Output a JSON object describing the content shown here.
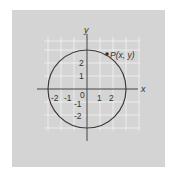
{
  "diagram": {
    "axes": {
      "x_label": "x",
      "y_label": "y",
      "x_ticks": [
        "-2",
        "-1",
        "0",
        "1",
        "2"
      ],
      "y_ticks": [
        "2",
        "1",
        "-1",
        "-2"
      ],
      "origin_label": "0"
    },
    "circle": {
      "center": [
        0,
        0
      ],
      "radius": 3
    },
    "point": {
      "label": "P(x, y)",
      "position": "on circle, upper right"
    },
    "colors": {
      "panel": "#d4d4d4",
      "grid": "#f2f2f2",
      "axis": "#444444",
      "circle": "#3a3a3a"
    }
  }
}
